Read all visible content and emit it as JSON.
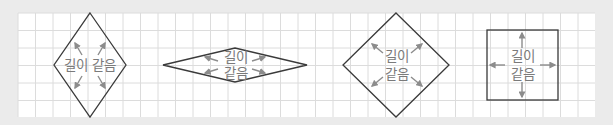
{
  "diagram": {
    "colors": {
      "background": "#ebebeb",
      "grid_fill": "#ffffff",
      "grid_line": "#dcdcdc",
      "shape_stroke": "#3a3a3a",
      "arrow": "#8c8c8c",
      "label": "#7a7a7a"
    },
    "grid": {
      "x": 18,
      "y": 13,
      "width": 577,
      "height": 104,
      "cell": 17.5
    },
    "shapes": [
      {
        "name": "tall-rhombus",
        "label_line1": "길이 같음",
        "label_line2": ""
      },
      {
        "name": "flat-rhombus",
        "label_line1": "길이",
        "label_line2": "같음"
      },
      {
        "name": "square-rhombus",
        "label_line1": "길이",
        "label_line2": "같음"
      },
      {
        "name": "square",
        "label_line1": "길이",
        "label_line2": "같음"
      }
    ]
  }
}
